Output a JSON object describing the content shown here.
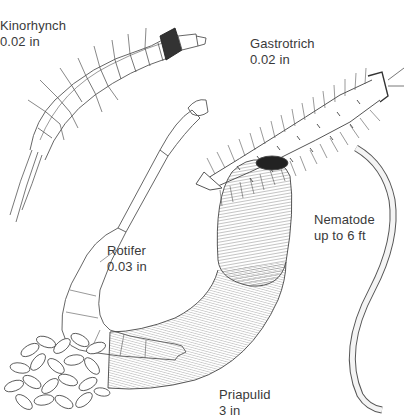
{
  "figure": {
    "background": "#ffffff",
    "ink_color": "#444444",
    "label_color": "#3a3a3a",
    "specimens": [
      {
        "id": "kinorhynch",
        "name": "Kinorhynch",
        "size": "0.02 in",
        "label_pos": [
          0,
          18
        ]
      },
      {
        "id": "gastrotrich",
        "name": "Gastrotrich",
        "size": "0.02 in",
        "label_pos": [
          250,
          36
        ]
      },
      {
        "id": "rotifer",
        "name": "Rotifer",
        "size": "0.03 in",
        "label_pos": [
          107,
          243
        ]
      },
      {
        "id": "nematode",
        "name": "Nematode",
        "size": "up to 6 ft",
        "label_pos": [
          314,
          212
        ]
      },
      {
        "id": "priapulid",
        "name": "Priapulid",
        "size": "3 in",
        "label_pos": [
          219,
          387
        ]
      }
    ]
  }
}
